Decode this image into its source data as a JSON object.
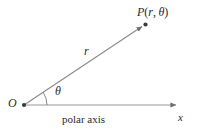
{
  "figure": {
    "background_color": "#ffffff",
    "line_color": "#8c8c8c",
    "text_color": "#2b2b2b",
    "labels": {
      "point": {
        "name": "P",
        "open_paren": "(",
        "radius": "r",
        "comma": ",",
        "angle": "θ",
        "close_paren": ")",
        "full": "P(r, θ)"
      },
      "radius": "r",
      "angle": "θ",
      "origin": "O",
      "axis_variable": "x",
      "axis_caption": "polar axis"
    },
    "geometry": {
      "origin": {
        "x": 24,
        "y": 105
      },
      "point_P": {
        "x": 146,
        "y": 24
      },
      "axis_end": {
        "x": 181,
        "y": 105
      },
      "arc_radius": 23,
      "angle_degrees": 34
    }
  }
}
